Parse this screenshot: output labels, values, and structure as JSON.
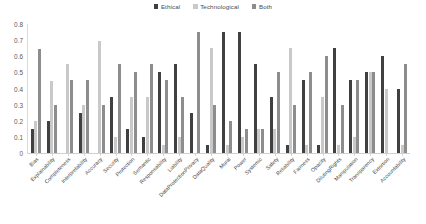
{
  "chart_data": {
    "type": "bar",
    "title": "",
    "xlabel": "",
    "ylabel": "",
    "ylim": [
      0,
      0.8
    ],
    "ytick_labels": [
      "0.8",
      "0.7",
      "0.6",
      "0.5",
      "0.4",
      "0.3",
      "0.2",
      "0.1",
      "0"
    ],
    "ytick_values": [
      0.8,
      0.7,
      0.6,
      0.5,
      0.4,
      0.3,
      0.2,
      0.1,
      0
    ],
    "grid": false,
    "legend_position": "top-center",
    "legend": [
      "Ethical",
      "Technological",
      "Both"
    ],
    "colors": {
      "Ethical": "#404040",
      "Technological": "#c9c9c9",
      "Both": "#8d8d8d"
    },
    "categories": [
      "Bias",
      "Explainability",
      "Completeness",
      "Interpretability",
      "Accuracy",
      "Security",
      "Protection",
      "Semantic",
      "Responsability",
      "Liability",
      "DataProtectionPrivacy",
      "DataQuality",
      "Moral",
      "Power",
      "Systemic",
      "Safety",
      "Reliability",
      "Fairness",
      "Opacity",
      "DilutingRights",
      "Manipulation",
      "Transparency",
      "Extortion",
      "Accountability"
    ],
    "series": [
      {
        "name": "Ethical",
        "values": [
          0.15,
          0.2,
          0,
          0.25,
          0,
          0.35,
          0.15,
          0.1,
          0.5,
          0.55,
          0.25,
          0.05,
          0.75,
          0.75,
          0.55,
          0.35,
          0.05,
          0.45,
          0.05,
          0.65,
          0.45,
          0.5,
          0.6,
          0.4
        ]
      },
      {
        "name": "Technological",
        "values": [
          0.2,
          0.445,
          0.55,
          0.3,
          0.695,
          0.1,
          0.35,
          0.35,
          0.05,
          0.1,
          0,
          0.65,
          0.05,
          0.1,
          0.15,
          0.15,
          0.65,
          0.05,
          0.35,
          0.05,
          0.1,
          0.5,
          0.4,
          0.05
        ]
      },
      {
        "name": "Both",
        "values": [
          0.645,
          0.295,
          0.45,
          0.45,
          0.3,
          0.55,
          0.5,
          0.55,
          0.45,
          0.35,
          0.75,
          0.3,
          0.2,
          0.15,
          0.15,
          0.5,
          0.3,
          0.5,
          0.6,
          0.3,
          0.45,
          0.5,
          0,
          0.555
        ]
      }
    ]
  }
}
